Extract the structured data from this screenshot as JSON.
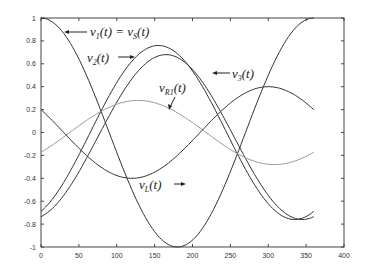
{
  "chart_data": {
    "type": "line",
    "title": "",
    "xlabel": "",
    "ylabel": "",
    "xlim": [
      0,
      400
    ],
    "ylim": [
      -1,
      1
    ],
    "xticks": [
      0,
      50,
      100,
      150,
      200,
      250,
      300,
      350,
      400
    ],
    "yticks": [
      1,
      0.8,
      0.6,
      0.4,
      0.2,
      0,
      -0.2,
      -0.4,
      -0.6,
      -0.8,
      -1
    ],
    "xtick_labels": [
      "0",
      "50",
      "100",
      "150",
      "200",
      "250",
      "300",
      "350",
      "400"
    ],
    "ytick_labels": [
      "1",
      "0.8",
      "0.6",
      "0.4",
      "0.2",
      "0",
      "-0.2",
      "-0.4",
      "-0.6",
      "-0.8",
      "-1"
    ],
    "grid": false,
    "legend": "none (inline annotations with arrows)",
    "x_domain": [
      0,
      360
    ],
    "series": [
      {
        "name": "v1(t) = vS(t)",
        "label_main": "v",
        "label_sub": "1",
        "label_rest": "(t) = v",
        "label_sub2": "S",
        "label_end": "(t)",
        "amplitude": 1.0,
        "phase_deg": 0,
        "offset": 0,
        "color": "#333333",
        "points": [
          [
            0,
            1
          ],
          [
            45,
            0.71
          ],
          [
            90,
            0
          ],
          [
            135,
            -0.71
          ],
          [
            180,
            -1
          ],
          [
            225,
            -0.71
          ],
          [
            270,
            0
          ],
          [
            315,
            0.71
          ],
          [
            360,
            1
          ]
        ]
      },
      {
        "name": "v2(t)",
        "label_main": "v",
        "label_sub": "2",
        "label_end": "(t)",
        "amplitude": 0.76,
        "phase_deg": 155,
        "offset": 0,
        "color": "#333333",
        "points": [
          [
            0,
            -0.69
          ],
          [
            60,
            -0.06
          ],
          [
            100,
            0.44
          ],
          [
            155,
            0.76
          ],
          [
            200,
            0.54
          ],
          [
            250,
            -0.06
          ],
          [
            300,
            -0.62
          ],
          [
            360,
            -0.69
          ]
        ]
      },
      {
        "name": "v3(t)",
        "label_main": "v",
        "label_sub": "3",
        "label_end": "(t)",
        "amplitude": 0.72,
        "phase_deg": 165,
        "offset": -0.04,
        "color": "#333333",
        "points": [
          [
            0,
            -0.71
          ],
          [
            60,
            -0.31
          ],
          [
            100,
            0.21
          ],
          [
            165,
            0.66
          ],
          [
            200,
            0.55
          ],
          [
            250,
            0.05
          ],
          [
            300,
            -0.55
          ],
          [
            340,
            -0.76
          ],
          [
            360,
            -0.72
          ]
        ]
      },
      {
        "name": "vR1(t)",
        "label_main": "v",
        "label_sub": "R1",
        "label_end": "(t)",
        "amplitude": 0.28,
        "phase_deg": 128,
        "offset": 0,
        "color": "#999999",
        "points": [
          [
            0,
            -0.18
          ],
          [
            60,
            0.15
          ],
          [
            128,
            0.28
          ],
          [
            200,
            0.08
          ],
          [
            260,
            -0.22
          ],
          [
            308,
            -0.28
          ],
          [
            360,
            -0.18
          ]
        ]
      },
      {
        "name": "vL(t)",
        "label_main": "v",
        "label_sub": "L",
        "label_end": "(t)",
        "amplitude": 0.4,
        "phase_deg": 300,
        "offset": 0,
        "color": "#333333",
        "points": [
          [
            0,
            0.2
          ],
          [
            60,
            -0.26
          ],
          [
            120,
            -0.4
          ],
          [
            180,
            -0.2
          ],
          [
            240,
            0.18
          ],
          [
            300,
            0.4
          ],
          [
            360,
            0.2
          ]
        ]
      }
    ]
  }
}
